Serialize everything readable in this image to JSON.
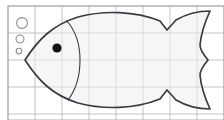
{
  "figure": {
    "canvas": {
      "width": 224,
      "height": 120,
      "background": "#ffffff"
    }
  },
  "grid": {
    "name": "graph-paper-grid",
    "line_color": "#b4b4b4",
    "line_width": 0.8,
    "cell_size": 27,
    "origin_x": 8,
    "origin_y": 6,
    "x_lines": [
      8,
      35,
      62,
      89,
      116,
      143,
      170,
      197,
      224
    ],
    "y_lines": [
      6,
      33,
      60,
      87,
      114
    ],
    "border_color": "#9a9a9a"
  },
  "fish": {
    "name": "fish-outline",
    "stroke_color": "#3a3a42",
    "stroke_width": 1.7,
    "fill_color": "#eeeeee",
    "fill_opacity": 0.55,
    "body_path": "M 25,60 C 38,40 52,25 78,17 C 104,10 135,11 160,21 L 167,30 L 176,20 C 188,13 199,11 210,11 C 205,22 201,33 200,45 C 200,48 203,54 208,60 C 203,66 200,72 200,75 C 201,87 205,98 210,109 C 199,109 188,107 176,100 L 167,90 L 160,99 C 135,109 104,110 78,103 C 52,95 38,80 25,60 Z",
    "gill_path": "M 66,20 C 78,33 80,48 80,60 C 80,72 78,87 68,100",
    "eye": {
      "name": "fish-eye",
      "cx": 57,
      "cy": 48,
      "r": 4.6,
      "color": "#111111"
    },
    "tail_notch_top": {
      "x": 167,
      "y": 30
    },
    "tail_notch_bottom": {
      "x": 167,
      "y": 90
    },
    "tail_waist": {
      "x": 208,
      "y": 60
    },
    "nose_point": {
      "x": 25,
      "y": 60
    }
  },
  "bubbles": {
    "name": "bubble-group",
    "stroke_color": "#8c8c8c",
    "stroke_width": 1.1,
    "fill": "none",
    "items": [
      {
        "name": "bubble-large",
        "cx": 22,
        "cy": 23,
        "r": 5.4
      },
      {
        "name": "bubble-medium",
        "cx": 20,
        "cy": 39,
        "r": 4.0
      },
      {
        "name": "bubble-small",
        "cx": 19,
        "cy": 51,
        "r": 2.8
      }
    ]
  }
}
